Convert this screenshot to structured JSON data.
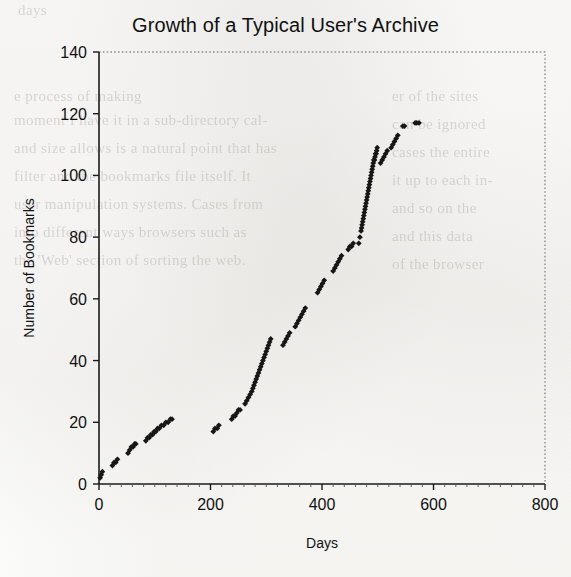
{
  "chart_data": {
    "type": "scatter",
    "title": "Growth of a Typical User's Archive",
    "xlabel": "Days",
    "ylabel": "Number of Bookmarks",
    "xlim": [
      0,
      800
    ],
    "ylim": [
      0,
      140
    ],
    "xticks": [
      0,
      200,
      400,
      600,
      800
    ],
    "yticks": [
      0,
      20,
      40,
      60,
      80,
      100,
      120,
      140
    ],
    "xtick_labels": [
      "0",
      "200",
      "400",
      "600",
      "800"
    ],
    "ytick_labels": [
      "0",
      "20",
      "40",
      "60",
      "80",
      "100",
      "120",
      "140"
    ],
    "grid": false,
    "legend": null,
    "marker": "filled-diamond",
    "marker_color": "#161616",
    "series": [
      {
        "name": "Cumulative bookmarks",
        "x": [
          2,
          4,
          6,
          24,
          27,
          30,
          33,
          52,
          55,
          58,
          61,
          64,
          66,
          84,
          87,
          90,
          93,
          96,
          99,
          102,
          105,
          108,
          112,
          116,
          120,
          124,
          128,
          131,
          205,
          208,
          212,
          215,
          238,
          241,
          244,
          247,
          250,
          253,
          262,
          265,
          268,
          271,
          274,
          276,
          278,
          280,
          282,
          284,
          286,
          288,
          290,
          292,
          294,
          296,
          298,
          300,
          302,
          304,
          306,
          308,
          330,
          333,
          336,
          339,
          342,
          352,
          355,
          358,
          361,
          364,
          367,
          370,
          392,
          395,
          398,
          401,
          404,
          420,
          423,
          426,
          429,
          432,
          435,
          447,
          450,
          453,
          456,
          466,
          468,
          470,
          471,
          472,
          473,
          474,
          475,
          476,
          477,
          478,
          479,
          480,
          481,
          482,
          483,
          484,
          485,
          486,
          487,
          488,
          489,
          490,
          491,
          492,
          493,
          494,
          495,
          496,
          497,
          498,
          499,
          505,
          508,
          511,
          514,
          517,
          524,
          527,
          530,
          533,
          536,
          545,
          548,
          567,
          570,
          574
        ],
        "y": [
          2,
          3,
          4,
          6,
          7,
          7,
          8,
          10,
          11,
          12,
          12,
          13,
          13,
          14,
          15,
          15,
          16,
          16,
          17,
          17,
          18,
          18,
          19,
          19,
          20,
          20,
          21,
          21,
          17,
          18,
          18,
          19,
          21,
          22,
          22,
          23,
          24,
          24,
          26,
          27,
          28,
          29,
          30,
          31,
          32,
          33,
          34,
          35,
          36,
          37,
          38,
          39,
          40,
          41,
          42,
          43,
          44,
          45,
          46,
          47,
          45,
          46,
          47,
          48,
          49,
          51,
          52,
          53,
          54,
          55,
          56,
          57,
          62,
          63,
          64,
          65,
          66,
          69,
          70,
          71,
          72,
          73,
          74,
          76,
          77,
          77,
          78,
          78,
          80,
          82,
          83,
          84,
          85,
          86,
          87,
          88,
          89,
          90,
          91,
          92,
          93,
          94,
          95,
          96,
          97,
          98,
          99,
          100,
          101,
          102,
          103,
          104,
          105,
          105,
          106,
          107,
          107,
          108,
          109,
          104,
          105,
          106,
          107,
          108,
          109,
          110,
          111,
          112,
          113,
          116,
          116,
          117,
          117,
          117
        ]
      }
    ]
  },
  "background_text": {
    "lines": [
      "days",
      "e process of making",
      "moment I have it in a sub-directory cal-",
      "and size allows is a natural point that has",
      "filter and the bookmarks file itself. It",
      "user manipulation systems. Cases from",
      "into different ways browsers such as",
      "the 'Web' section of sorting the web."
    ],
    "lines_right": [
      "er of the sites",
      "can be ignored",
      "cases the entire",
      "it up to each in-",
      "and so on the",
      "and this data",
      "of the browser"
    ]
  }
}
